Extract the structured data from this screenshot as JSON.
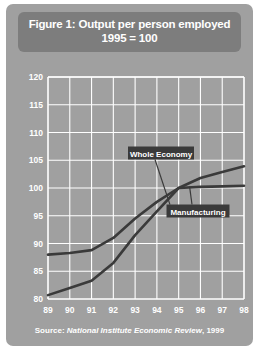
{
  "figure": {
    "title_line_1": "Figure 1: Output per person employed",
    "title_line_2": "1995 = 100",
    "source_prefix": "Source:",
    "source_journal": "National Institute Economic Review",
    "source_year": ", 1999"
  },
  "colors": {
    "panel_background": "#a0a0a0",
    "title_box": "#7d7d7d",
    "gridline": "#ffffff",
    "line": "#3a3a3a",
    "label_box": "#3a3a3a",
    "text": "#ffffff"
  },
  "chart_data": {
    "type": "line",
    "title": "Figure 1: Output per person employed 1995 = 100",
    "xlabel": "",
    "ylabel": "",
    "categories": [
      "89",
      "90",
      "91",
      "92",
      "93",
      "94",
      "95",
      "96",
      "97",
      "98"
    ],
    "x": [
      89,
      90,
      91,
      92,
      93,
      94,
      95,
      96,
      97,
      98
    ],
    "xlim": [
      89,
      98
    ],
    "ylim": [
      80,
      120
    ],
    "yticks": [
      80,
      85,
      90,
      95,
      100,
      105,
      110,
      115,
      120
    ],
    "xticks": [
      "89",
      "90",
      "91",
      "92",
      "93",
      "94",
      "95",
      "96",
      "97",
      "98"
    ],
    "grid": true,
    "legend": "inline-annotations",
    "series": [
      {
        "name": "Whole Economy",
        "values": [
          88.0,
          88.3,
          88.8,
          91.0,
          94.5,
          97.5,
          100.0,
          100.2,
          100.3,
          100.4
        ]
      },
      {
        "name": "Manufacturing",
        "values": [
          80.7,
          82.0,
          83.3,
          86.5,
          91.5,
          95.8,
          100.0,
          101.8,
          102.9,
          103.9
        ]
      }
    ],
    "annotations": [
      {
        "label": "Whole Economy",
        "target_x": 94.6,
        "target_y": 97.0
      },
      {
        "label": "Manufacturing",
        "target_x": 95.5,
        "target_y": 100.3
      }
    ]
  }
}
